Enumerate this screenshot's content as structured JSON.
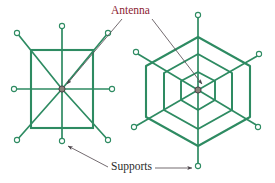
{
  "figure": {
    "title_labels": {
      "antenna": "Antenna",
      "supports": "Supports"
    },
    "colors": {
      "structure_green": "#2e8b62",
      "structure_green_dark": "#1f6e4a",
      "antenna_label": "#8c2433",
      "supports_label": "#2b2b2b",
      "leader_line": "#5a5056",
      "node_fill": "#ffffff",
      "hub_fill": "#8a8078",
      "background": "#ffffff"
    },
    "left_structure": {
      "name": "square-antenna-support-frame",
      "center": [
        124,
        111
      ],
      "spoke_count": 8,
      "ring_count": 1,
      "ring_shape": "square",
      "has_diagonals": true,
      "hub_label": "Antenna",
      "node_label": "Supports",
      "spoke_nodes": [
        [
          59,
          100
        ],
        [
          205,
          100
        ],
        [
          352,
          100
        ],
        [
          59,
          265
        ],
        [
          352,
          265
        ],
        [
          59,
          415
        ],
        [
          205,
          418
        ],
        [
          352,
          415
        ]
      ]
    },
    "right_structure": {
      "name": "hexagonal-antenna-support-web",
      "center": [
        596,
        270
      ],
      "spoke_count": 6,
      "ring_count": 3,
      "ring_shape": "hexagon",
      "has_diagonals": false,
      "hub_label": "Antenna",
      "node_label": "Supports",
      "spoke_nodes": [
        [
          596,
          44
        ],
        [
          412,
          155
        ],
        [
          778,
          163
        ],
        [
          404,
          379
        ],
        [
          775,
          379
        ],
        [
          596,
          495
        ]
      ]
    },
    "annotations": [
      {
        "name": "antenna-leader-left",
        "from_label": "Antenna",
        "points_to": "left-structure-hub",
        "arrowhead": true
      },
      {
        "name": "antenna-leader-right",
        "from_label": "Antenna",
        "points_to": "right-structure-hub",
        "arrowhead": true
      },
      {
        "name": "supports-leader-left",
        "from_label": "Supports",
        "points_to": "left-structure-bottom-node",
        "arrowhead": true
      },
      {
        "name": "supports-leader-right",
        "from_label": "Supports",
        "points_to": "right-structure-bottom-node",
        "arrowhead": true
      }
    ]
  }
}
